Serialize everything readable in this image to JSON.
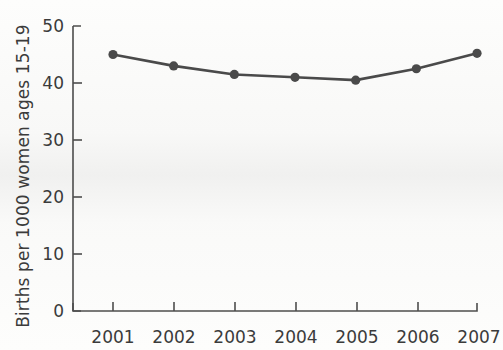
{
  "chart_data": {
    "type": "line",
    "title": "",
    "subtitle": "",
    "xlabel": "",
    "ylabel": "Births per 1000 women ages 15-19",
    "categories": [
      "2001",
      "2002",
      "2003",
      "2004",
      "2005",
      "2006",
      "2007"
    ],
    "x": [
      2001,
      2002,
      2003,
      2004,
      2005,
      2006,
      2007
    ],
    "values": [
      45.0,
      43.0,
      41.5,
      41.0,
      40.5,
      42.5,
      45.2
    ],
    "series": [
      {
        "name": "Births per 1000 women ages 15-19",
        "values": [
          45.0,
          43.0,
          41.5,
          41.0,
          40.5,
          42.5,
          45.2
        ]
      }
    ],
    "ylim": [
      0,
      50
    ],
    "ytick_labels": [
      "0",
      "10",
      "20",
      "30",
      "40",
      "50"
    ],
    "yticks": [
      0,
      10,
      20,
      30,
      40,
      50
    ],
    "xtick_labels": [
      "2001",
      "2002",
      "2003",
      "2004",
      "2005",
      "2006",
      "2007"
    ],
    "grid": false,
    "legend": "none",
    "line_color": "#4a4a4a",
    "marker": "circle",
    "marker_color": "#4a4a4a",
    "axis_color": "#4d4d4d",
    "background_color": "#fdfdfc"
  },
  "axes": {
    "y_title": "Births per 1000 women ages 15-19",
    "y_ticks": [
      {
        "label": "50"
      },
      {
        "label": "40"
      },
      {
        "label": "30"
      },
      {
        "label": "20"
      },
      {
        "label": "10"
      },
      {
        "label": "0"
      }
    ],
    "x_ticks": [
      {
        "label": "2001"
      },
      {
        "label": "2002"
      },
      {
        "label": "2003"
      },
      {
        "label": "2004"
      },
      {
        "label": "2005"
      },
      {
        "label": "2006"
      },
      {
        "label": "2007"
      }
    ]
  }
}
